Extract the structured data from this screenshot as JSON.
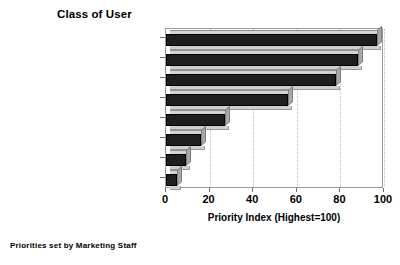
{
  "chart_data": {
    "type": "bar",
    "orientation": "horizontal",
    "title": "Class of User",
    "subtitle": "",
    "xlabel": "Priority Index (Highest=100)",
    "ylabel": "",
    "xlim": [
      0,
      100
    ],
    "xticks": [
      0,
      20,
      40,
      60,
      80,
      100
    ],
    "xtick_labels": [
      "0",
      "20",
      "40",
      "60",
      "80",
      "100"
    ],
    "grid": true,
    "grid_axis": "x",
    "legend": false,
    "legend_position": "none",
    "categories": [
      "Customer Service",
      "New Customer Sales",
      "Special Users",
      "Regular Reports",
      "Ad-Hoc Reports",
      "Selecting Records",
      "Nightly Backups",
      "Statistical Modeling"
    ],
    "values": [
      97,
      88,
      78,
      56,
      27,
      16,
      9,
      5
    ],
    "series": [
      {
        "name": "Priority Index",
        "values": [
          97,
          88,
          78,
          56,
          27,
          16,
          9,
          5
        ]
      }
    ],
    "annotations": [
      "Priorities set by Marketing Staff"
    ],
    "style": "3d-horizontal-bar"
  },
  "colors": {
    "bar_face": "#1e1e1e",
    "bar_top": "#d4d4d4",
    "bar_side": "#a8a8a8",
    "bar_shadow": "#cfcfcf",
    "grid": "#bdbdbd",
    "frame": "#9a9a9a",
    "text": "#000000",
    "background": "#ffffff"
  },
  "footnote": "Priorities set by Marketing Staff"
}
